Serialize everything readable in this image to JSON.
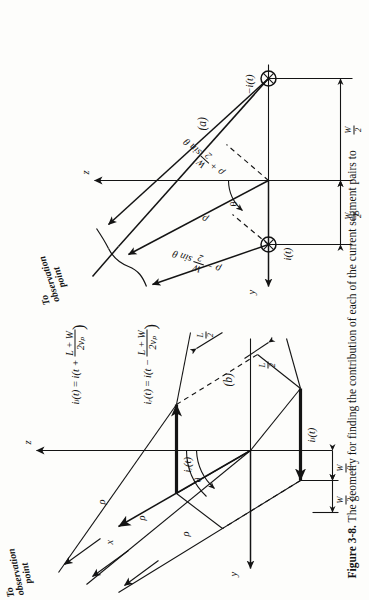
{
  "figure": {
    "number": "Figure 3-8.",
    "caption_text": "The geometry for finding the contribution of each of the current segment pairs to",
    "panel_a_label": "(a)",
    "panel_b_label": "(b)"
  },
  "panel_a": {
    "name": "panel-a-geometry",
    "axes": {
      "y_label": "y",
      "z_label": "z"
    },
    "angle_label": "θ",
    "source_left_label": "i(t)",
    "source_right_label": "−i(t)",
    "dimension_left": {
      "num": "W",
      "den": "2"
    },
    "dimension_right": {
      "num": "W",
      "den": "2"
    },
    "ray_far_label_prefix": "ρ − ",
    "ray_far_label_frac": {
      "num": "W",
      "den": "2"
    },
    "ray_far_label_suffix": " sin θ",
    "ray_mid_label": "ρ",
    "ray_near_label_prefix": "ρ + ",
    "ray_near_label_frac": {
      "num": "W",
      "den": "2"
    },
    "ray_near_label_suffix": " sin θ",
    "observation_note_line1": "To",
    "observation_note_line2": "observation",
    "observation_note_line3": "point"
  },
  "panel_b": {
    "name": "panel-b-geometry",
    "axes": {
      "x_label": "x",
      "y_label": "y",
      "z_label": "z"
    },
    "angle_label": "θ",
    "current_left_label": "iₗ(t)",
    "current_right_label": "iᵣ(t)",
    "dimension_w_upper": {
      "num": "W",
      "den": "2"
    },
    "dimension_w_lower": {
      "num": "W",
      "den": "2"
    },
    "dimension_l_upper": {
      "num": "L",
      "den": "2"
    },
    "dimension_l_lower": {
      "num": "L",
      "den": "2"
    },
    "ray_labels": [
      "ρ",
      "ρ",
      "ρ"
    ],
    "observation_note_line1": "To",
    "observation_note_line2": "observation",
    "observation_note_line3": "point",
    "equation_1": {
      "lhs": "iₗ(t)",
      "eq": "=",
      "rhs_head": "i(t + ",
      "rhs_num": "L + W",
      "rhs_den": "2vₚ",
      "rhs_tail": ")"
    },
    "equation_2": {
      "lhs": "iᵣ(t)",
      "eq": "=",
      "rhs_head": "i(t − ",
      "rhs_num": "L + W",
      "rhs_den": "2vₚ",
      "rhs_tail": ")"
    }
  },
  "colors": {
    "ink": "#141414",
    "paper": "#fdfdfb"
  }
}
